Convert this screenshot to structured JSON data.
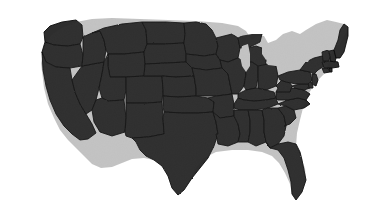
{
  "figure": {
    "kind": "map-image",
    "name": "contiguous-united-states-map",
    "title": "Map of the contiguous United States",
    "has_text_labels": false,
    "has_legend": false,
    "has_title_text": false,
    "width_px": 368,
    "height_px": 224
  },
  "colors": {
    "background": "#ffffff",
    "land_fill": "#2e2e2e",
    "state_border": "#0b0b0b",
    "water_cutout": "#ffffff"
  },
  "map": {
    "projection_look": "albers-usa",
    "region": "Contiguous United States (lower 48)",
    "includes_alaska": false,
    "includes_hawaii": false,
    "state_borders_visible": true,
    "coastline_texture": "dithered / noisy scan",
    "landmass_bounds_px": {
      "left": 38,
      "top": 18,
      "right": 348,
      "bottom": 201
    },
    "notable_features": [
      "Great Lakes rendered as white cutouts",
      "Florida peninsula extends to lower right",
      "Maine forms the upper right extreme",
      "Texas southern tip dips below the Gulf coastline",
      "Rectangular Plains and Mountain states visible as straight borders"
    ],
    "states": [
      "Washington",
      "Oregon",
      "California",
      "Nevada",
      "Idaho",
      "Montana",
      "Wyoming",
      "Utah",
      "Arizona",
      "Colorado",
      "New Mexico",
      "North Dakota",
      "South Dakota",
      "Nebraska",
      "Kansas",
      "Oklahoma",
      "Texas",
      "Minnesota",
      "Iowa",
      "Missouri",
      "Arkansas",
      "Louisiana",
      "Wisconsin",
      "Illinois",
      "Michigan",
      "Indiana",
      "Ohio",
      "Kentucky",
      "Tennessee",
      "Mississippi",
      "Alabama",
      "Georgia",
      "Florida",
      "South Carolina",
      "North Carolina",
      "Virginia",
      "West Virginia",
      "Maryland",
      "Delaware",
      "Pennsylvania",
      "New Jersey",
      "New York",
      "Connecticut",
      "Rhode Island",
      "Massachusetts",
      "Vermont",
      "New Hampshire",
      "Maine"
    ]
  }
}
